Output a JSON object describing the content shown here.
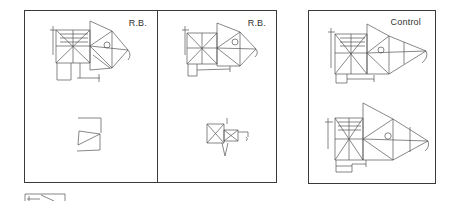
{
  "figure": {
    "panels": [
      {
        "id": "rb-1",
        "label": "R.B.",
        "drawings": [
          "copy",
          "recall"
        ]
      },
      {
        "id": "rb-2",
        "label": "R.B.",
        "drawings": [
          "copy",
          "recall"
        ]
      },
      {
        "id": "control",
        "label": "Control",
        "drawings": [
          "copy",
          "recall"
        ]
      }
    ],
    "thumbnail": {
      "name": "reference-figure-thumbnail"
    }
  },
  "colors": {
    "line": "#555555",
    "border": "#3a3a3a",
    "background": "#ffffff"
  }
}
